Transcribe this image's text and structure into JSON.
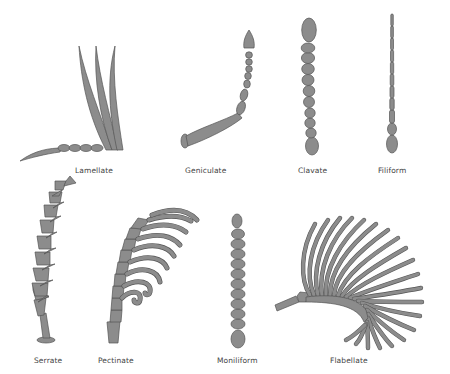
{
  "colors": {
    "fill": "#8c8c8c",
    "stroke": "#555555",
    "background": "#ffffff",
    "label": "#444444"
  },
  "antennae": [
    {
      "name": "Lamellate",
      "row": 1,
      "label_pos": [
        75,
        166
      ]
    },
    {
      "name": "Geniculate",
      "row": 1,
      "label_pos": [
        185,
        166
      ]
    },
    {
      "name": "Clavate",
      "row": 1,
      "label_pos": [
        298,
        166
      ]
    },
    {
      "name": "Filiform",
      "row": 1,
      "label_pos": [
        378,
        166
      ]
    },
    {
      "name": "Serrate",
      "row": 2,
      "label_pos": [
        34,
        356
      ]
    },
    {
      "name": "Pectinate",
      "row": 2,
      "label_pos": [
        98,
        356
      ]
    },
    {
      "name": "Moniliform",
      "row": 2,
      "label_pos": [
        217,
        356
      ]
    },
    {
      "name": "Flabellate",
      "row": 2,
      "label_pos": [
        330,
        356
      ]
    }
  ]
}
